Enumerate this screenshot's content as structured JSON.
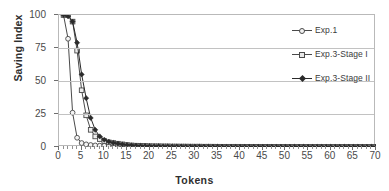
{
  "chart_data": {
    "type": "line",
    "title": "",
    "xlabel": "Tokens",
    "ylabel": "Saving Index",
    "xlim": [
      0,
      70
    ],
    "ylim": [
      0,
      100
    ],
    "xticks": [
      0,
      5,
      10,
      15,
      20,
      25,
      30,
      35,
      40,
      45,
      50,
      55,
      60,
      65,
      70
    ],
    "yticks": [
      0,
      25,
      50,
      75,
      100
    ],
    "xtick_labels": [
      "0",
      "5",
      "10",
      "15",
      "20",
      "25",
      "30",
      "35",
      "40",
      "45",
      "50",
      "55",
      "60",
      "65",
      "70"
    ],
    "ytick_labels": [
      "0",
      "25",
      "50",
      "75",
      "100"
    ],
    "x_minor_step": 1,
    "grid": "horizontal",
    "legend_position": "right",
    "x": [
      1,
      2,
      3,
      4,
      5,
      6,
      7,
      8,
      9,
      10,
      11,
      12,
      13,
      14,
      15,
      16,
      17,
      18,
      19,
      20,
      21,
      22,
      23,
      24,
      25,
      26,
      27,
      28,
      29,
      30,
      31,
      32,
      33,
      34,
      35,
      36,
      37,
      38,
      39,
      40,
      41,
      42,
      43,
      44,
      45,
      46,
      47,
      48,
      49,
      50,
      51,
      52,
      53,
      54,
      55,
      56,
      57,
      58,
      59,
      60,
      61,
      62,
      63,
      64,
      65,
      66,
      67,
      68,
      69,
      70
    ],
    "series": [
      {
        "name": "Exp.1",
        "marker": "open-circle",
        "color": "#4a4a4a",
        "values": [
          100,
          82,
          26,
          7,
          3,
          2,
          1.5,
          1.2,
          1,
          0.9,
          0.8,
          0.7,
          0.6,
          0.5,
          0.4,
          0.35,
          0.3,
          0.3,
          0.25,
          0.25,
          0.2,
          0.2,
          0.2,
          0.2,
          0.15,
          0.15,
          0.15,
          0.15,
          0.1,
          0.1,
          0.1,
          0.1,
          0.1,
          0.1,
          0.1,
          0.1,
          0.1,
          0.1,
          0.1,
          0.1,
          0.1,
          0.1,
          0.1,
          0.1,
          0.1,
          0.1,
          0.1,
          0.1,
          0.1,
          0.1,
          0.1,
          0.1,
          0.1,
          0.1,
          0.1,
          0.1,
          0.1,
          0.1,
          0.1,
          0.1,
          0.1,
          0.1,
          0.1,
          0.1,
          0.1,
          0.1,
          0.1,
          0.1,
          0.1,
          0.1
        ]
      },
      {
        "name": "Exp.3-Stage I",
        "marker": "open-square",
        "color": "#4a4a4a",
        "values": [
          100,
          100,
          95,
          73,
          43,
          24,
          13,
          8,
          6,
          4.5,
          3.5,
          3,
          2.5,
          2,
          1.5,
          1.2,
          1,
          0.9,
          0.8,
          0.7,
          0.6,
          0.6,
          0.5,
          0.5,
          0.4,
          0.4,
          0.35,
          0.35,
          0.3,
          0.3,
          0.3,
          0.25,
          0.25,
          0.25,
          0.2,
          0.2,
          0.2,
          0.2,
          0.2,
          0.2,
          0.15,
          0.15,
          0.15,
          0.15,
          0.15,
          0.15,
          0.15,
          0.1,
          0.1,
          0.1,
          0.1,
          0.1,
          0.1,
          0.1,
          0.1,
          0.1,
          0.1,
          0.1,
          0.1,
          0.1,
          0.1,
          0.1,
          0.1,
          0.1,
          0.1,
          0.1,
          0.1,
          0.1,
          0.1,
          0.1
        ]
      },
      {
        "name": "Exp.3-Stage II",
        "marker": "filled-diamond",
        "color": "#2b2b2b",
        "values": [
          100,
          99,
          95,
          79,
          55,
          37,
          22,
          13,
          8,
          5.5,
          4,
          3.2,
          2.6,
          2,
          1.6,
          1.3,
          1.1,
          0.95,
          0.85,
          0.75,
          0.65,
          0.6,
          0.55,
          0.5,
          0.45,
          0.4,
          0.4,
          0.35,
          0.35,
          0.3,
          0.3,
          0.3,
          0.25,
          0.25,
          0.25,
          0.25,
          0.2,
          0.2,
          0.2,
          0.2,
          0.2,
          0.2,
          0.15,
          0.15,
          0.15,
          0.15,
          0.15,
          0.15,
          0.15,
          0.15,
          0.1,
          0.1,
          0.1,
          0.1,
          0.1,
          0.1,
          0.1,
          0.1,
          0.1,
          0.1,
          0.1,
          0.1,
          0.1,
          0.1,
          0.1,
          0.1,
          0.1,
          0.1,
          0.1,
          0.1
        ]
      }
    ]
  },
  "axes": {
    "y_title": "Saving Index",
    "x_title": "Tokens"
  },
  "legend": {
    "items": [
      {
        "label": "Exp.1"
      },
      {
        "label": "Exp.3-Stage I"
      },
      {
        "label": "Exp.3-Stage II"
      }
    ]
  },
  "colors": {
    "line": "#4a4a4a",
    "line_dark": "#2b2b2b",
    "grid": "#c2c2c2",
    "frame": "#b9b9b9",
    "text": "#3c3c3c",
    "background": "#ffffff"
  }
}
